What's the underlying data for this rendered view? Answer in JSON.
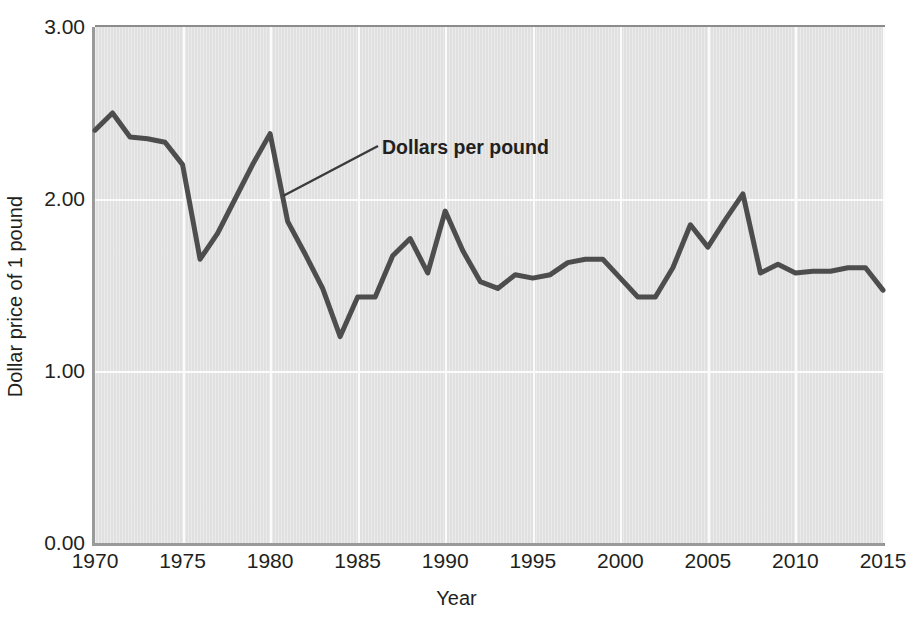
{
  "chart_data": {
    "type": "line",
    "title": "",
    "xlabel": "Year",
    "ylabel": "Dollar price of 1 pound",
    "xlim": [
      1970,
      2015
    ],
    "ylim": [
      0.0,
      3.0
    ],
    "yticks": [
      "0.00",
      "1.00",
      "2.00",
      "3.00"
    ],
    "ytick_values": [
      0.0,
      1.0,
      2.0,
      3.0
    ],
    "xticks": [
      "1970",
      "1975",
      "1980",
      "1985",
      "1990",
      "1995",
      "2000",
      "2005",
      "2010",
      "2015"
    ],
    "xtick_values": [
      1970,
      1975,
      1980,
      1985,
      1990,
      1995,
      2000,
      2005,
      2010,
      2015
    ],
    "grid": true,
    "legend": "none",
    "annotations": [
      {
        "text": "Dollars per pound",
        "label_x": 382,
        "label_y": 136,
        "leader_from_x": 378,
        "leader_from_y": 146,
        "leader_to_x": 283,
        "leader_to_y": 196
      }
    ],
    "series": [
      {
        "name": "Dollars per pound",
        "color": "#4d4d4d",
        "line_width": 5,
        "x": [
          1970,
          1971,
          1972,
          1973,
          1974,
          1975,
          1976,
          1977,
          1978,
          1979,
          1980,
          1981,
          1982,
          1983,
          1984,
          1985,
          1986,
          1987,
          1988,
          1989,
          1990,
          1991,
          1992,
          1993,
          1994,
          1995,
          1996,
          1997,
          1998,
          1999,
          2000,
          2001,
          2002,
          2003,
          2004,
          2005,
          2006,
          2007,
          2008,
          2009,
          2010,
          2011,
          2012,
          2013,
          2014,
          2015
        ],
        "y": [
          2.4,
          2.5,
          2.36,
          2.35,
          2.33,
          2.2,
          1.65,
          1.8,
          2.0,
          2.2,
          2.38,
          1.87,
          1.68,
          1.48,
          1.2,
          1.43,
          1.43,
          1.67,
          1.77,
          1.57,
          1.93,
          1.7,
          1.52,
          1.48,
          1.56,
          1.54,
          1.56,
          1.63,
          1.65,
          1.65,
          1.54,
          1.43,
          1.43,
          1.6,
          1.85,
          1.72,
          1.88,
          2.03,
          1.57,
          1.62,
          1.57,
          1.58,
          1.58,
          1.6,
          1.6,
          1.47
        ]
      }
    ]
  },
  "axes": {
    "y_axis_label": "Dollar price of 1 pound",
    "x_axis_label": "Year"
  }
}
